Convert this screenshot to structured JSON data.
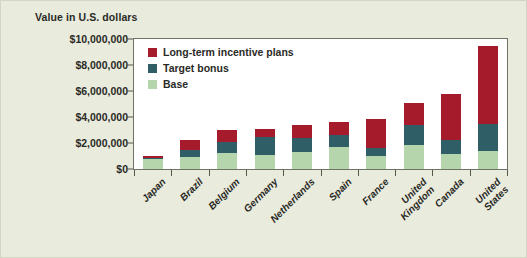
{
  "figure": {
    "background_color": "#e9ebdd",
    "plot_background_color": "#ffffff"
  },
  "chart_data": {
    "type": "bar",
    "subtype": "stacked-vertical",
    "title": "",
    "ylabel": "Value in U.S. dollars",
    "xlabel": "",
    "ylim": [
      0,
      10000000
    ],
    "ytick_labels": [
      "$10,000,000",
      "$8,000,000",
      "$6,000,000",
      "$4,000,000",
      "$2,000,000",
      "$0"
    ],
    "ytick_values": [
      10000000,
      8000000,
      6000000,
      4000000,
      2000000,
      0
    ],
    "grid": false,
    "legend_position": "inside-top-left",
    "categories": [
      "Japan",
      "Brazil",
      "Belgium",
      "Germany",
      "Netherlands",
      "Spain",
      "France",
      "United Kingdom",
      "Canada",
      "United States"
    ],
    "series": [
      {
        "name": "Base",
        "color": "#b5d6ac",
        "values": [
          750000,
          950000,
          1200000,
          1050000,
          1300000,
          1700000,
          1000000,
          1850000,
          1150000,
          1400000
        ]
      },
      {
        "name": "Target bonus",
        "color": "#2f5e66",
        "values": [
          100000,
          550000,
          850000,
          1400000,
          1050000,
          900000,
          650000,
          1550000,
          1100000,
          2050000
        ]
      },
      {
        "name": "Long-term incentive plans",
        "color": "#a51b2b",
        "values": [
          150000,
          700000,
          950000,
          600000,
          1000000,
          1050000,
          2200000,
          1650000,
          3550000,
          6050000
        ]
      }
    ],
    "totals": [
      1000000,
      2200000,
      3000000,
      3050000,
      3350000,
      3650000,
      3850000,
      5050000,
      5800000,
      9500000
    ]
  },
  "legend": {
    "items": [
      {
        "label": "Long-term incentive plans",
        "color": "#a51b2b"
      },
      {
        "label": "Target bonus",
        "color": "#2f5e66"
      },
      {
        "label": "Base",
        "color": "#b5d6ac"
      }
    ]
  }
}
